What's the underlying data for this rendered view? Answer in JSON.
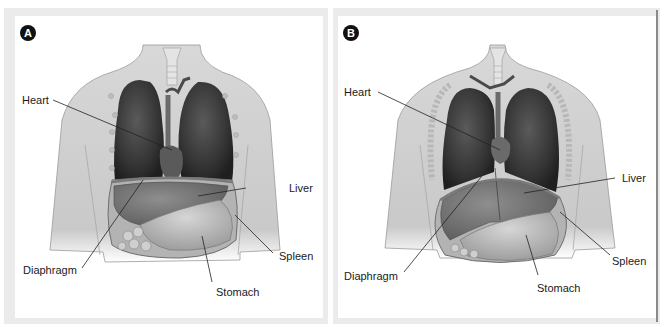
{
  "figure": {
    "panels": [
      {
        "id": "A",
        "badge": "A",
        "labels": {
          "heart": "Heart",
          "liver": "Liver",
          "diaphragm": "Diaphragm",
          "spleen": "Spleen",
          "stomach": "Stomach"
        }
      },
      {
        "id": "B",
        "badge": "B",
        "labels": {
          "heart": "Heart",
          "liver": "Liver",
          "diaphragm": "Diaphragm",
          "spleen": "Spleen",
          "stomach": "Stomach"
        }
      }
    ]
  },
  "colors": {
    "skin": "#cfcfcf",
    "skin_edge": "#8f8f8f",
    "lung": "#3a3a3a",
    "organ": "#8a8a8a",
    "stomach": "#b9b9b9",
    "badge": "#111111",
    "frame": "#ebebeb"
  }
}
